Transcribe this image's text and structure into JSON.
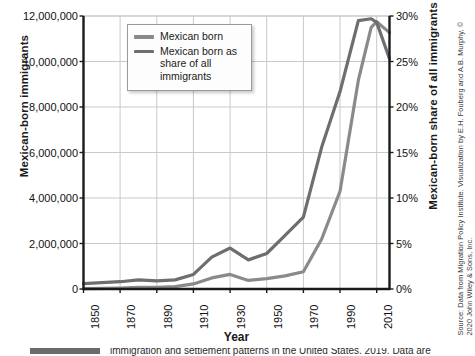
{
  "chart": {
    "title": "",
    "xlabel": "Year",
    "ylabel_left": "Mexican-born immigrants",
    "ylabel_right": "Mexican-born share of all immigrants",
    "source": "Source: Data from Migration Policy Institute. Visualization by E.H. Fouberg and A.B. Murphy, © 2020 John Wiley & Sons, Inc.",
    "legend": {
      "items": [
        {
          "label": "Mexican born",
          "color": "#8a8a8a"
        },
        {
          "label": "Mexican born as share of all immigrants",
          "color": "#6e6e6e"
        }
      ]
    },
    "caption": "immigration and settlement patterns in the United States. 2019. Data are"
  },
  "axes": {
    "left_ticks": [
      "0",
      "2,000,000",
      "4,000,000",
      "6,000,000",
      "8,000,000",
      "10,000,000",
      "12,000,000"
    ],
    "right_ticks": [
      "0%",
      "5%",
      "10%",
      "15%",
      "20%",
      "25%",
      "30%"
    ],
    "x_ticks": [
      "1850",
      "1870",
      "1890",
      "1910",
      "1930",
      "1950",
      "1970",
      "1990",
      "2010"
    ],
    "left_min": 0,
    "left_max": 12000000,
    "right_min": 0,
    "right_max": 30,
    "x_min": 1850,
    "x_max": 2017,
    "grid": true
  },
  "chart_data": {
    "type": "line",
    "title": "",
    "xlabel": "Year",
    "ylabel": "Mexican-born immigrants",
    "ylabel_secondary": "Mexican-born share of all immigrants",
    "xlim": [
      1850,
      2017
    ],
    "ylim": [
      0,
      12000000
    ],
    "ylim_secondary": [
      0,
      30
    ],
    "grid": true,
    "legend_position": "top-left-inside",
    "x": [
      1850,
      1860,
      1870,
      1880,
      1890,
      1900,
      1910,
      1920,
      1930,
      1940,
      1950,
      1960,
      1970,
      1980,
      1990,
      2000,
      2007,
      2010,
      2017
    ],
    "series": [
      {
        "name": "Mexican born",
        "axis": "left",
        "color": "#8a8a8a",
        "unit": "people",
        "values": [
          13300,
          27500,
          42400,
          68400,
          77900,
          103400,
          221900,
          486400,
          641500,
          377400,
          454000,
          576000,
          760000,
          2199000,
          4298000,
          9177000,
          11500000,
          11746000,
          11270000
        ]
      },
      {
        "name": "Mexican born as share of all immigrants",
        "axis": "right",
        "color": "#6e6e6e",
        "unit": "percent",
        "values": [
          0.6,
          0.7,
          0.8,
          1.0,
          0.9,
          1.0,
          1.6,
          3.5,
          4.5,
          3.2,
          3.9,
          5.9,
          7.9,
          15.6,
          21.7,
          29.5,
          29.7,
          29.3,
          25.3
        ]
      }
    ]
  }
}
